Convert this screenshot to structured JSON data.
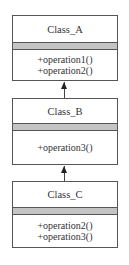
{
  "diagram": {
    "type": "uml-class-inheritance",
    "classes": [
      {
        "name": "Class_A",
        "attributes": [],
        "operations": [
          "+operation1()",
          "+operation2()"
        ]
      },
      {
        "name": "Class_B",
        "attributes": [],
        "operations": [
          "+operation3()"
        ]
      },
      {
        "name": "Class_C",
        "attributes": [],
        "operations": [
          "+operation2()",
          "+operation3()"
        ]
      }
    ],
    "relations": [
      {
        "from": "Class_B",
        "to": "Class_A",
        "kind": "inheritance-arrow"
      },
      {
        "from": "Class_C",
        "to": "Class_B",
        "kind": "inheritance-arrow"
      }
    ],
    "colors": {
      "border": "#555555",
      "attribute_band": "#c4c4c4",
      "text": "#333333",
      "background": "#ffffff"
    }
  }
}
